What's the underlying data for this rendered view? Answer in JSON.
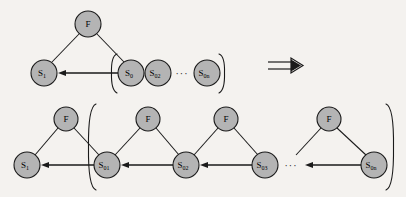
{
  "figure": {
    "type": "graph-rewriting-rule",
    "background_color": "#f4f2ef",
    "node_fill_color": "#b4b4b4",
    "node_stroke_color": "#1a1a1a",
    "implication_symbol": "⇒",
    "ellipsis_symbol": "···"
  },
  "top_row": {
    "label": "left-hand-side",
    "nodes": [
      {
        "id": "top-f",
        "label": "F",
        "sub": "",
        "cx": 88,
        "cy": 24,
        "r": 13
      },
      {
        "id": "top-s1",
        "label": "S",
        "sub": "1",
        "cx": 44,
        "cy": 73,
        "r": 13
      },
      {
        "id": "top-s0",
        "label": "S",
        "sub": "0",
        "cx": 131,
        "cy": 73,
        "r": 13
      },
      {
        "id": "top-s02",
        "label": "S",
        "sub": "02",
        "cx": 158,
        "cy": 73,
        "r": 13
      },
      {
        "id": "top-s0n",
        "label": "S",
        "sub": "0n",
        "cx": 207,
        "cy": 73,
        "r": 13
      }
    ],
    "edges": [
      {
        "from": "top-f",
        "to": "top-s1",
        "kind": "plain"
      },
      {
        "from": "top-f",
        "to": "top-s0",
        "kind": "plain"
      }
    ],
    "arrows": [
      {
        "from": "top-s0",
        "to": "top-s1",
        "kind": "arrow-left"
      }
    ],
    "ellipsis": {
      "x": 182,
      "y": 75
    },
    "brackets": [
      {
        "side": "open",
        "x": 113,
        "y_top": 54,
        "y_bottom": 93
      },
      {
        "side": "close",
        "x": 223,
        "y_top": 54,
        "y_bottom": 93
      }
    ]
  },
  "implication": {
    "symbol": "⇒",
    "x": 283,
    "y": 66
  },
  "bottom_row": {
    "label": "right-hand-side",
    "nodes": [
      {
        "id": "bot-f1",
        "label": "F",
        "sub": "",
        "cx": 66,
        "cy": 119,
        "r": 12
      },
      {
        "id": "bot-f2",
        "label": "F",
        "sub": "",
        "cx": 148,
        "cy": 119,
        "r": 12
      },
      {
        "id": "bot-f3",
        "label": "F",
        "sub": "",
        "cx": 226,
        "cy": 119,
        "r": 12
      },
      {
        "id": "bot-f4",
        "label": "F",
        "sub": "",
        "cx": 329,
        "cy": 119,
        "r": 12
      },
      {
        "id": "bot-s1",
        "label": "S",
        "sub": "1",
        "cx": 27,
        "cy": 165,
        "r": 13
      },
      {
        "id": "bot-s01",
        "label": "S",
        "sub": "01",
        "cx": 107,
        "cy": 165,
        "r": 13
      },
      {
        "id": "bot-s02",
        "label": "S",
        "sub": "02",
        "cx": 186,
        "cy": 165,
        "r": 13
      },
      {
        "id": "bot-s03",
        "label": "S",
        "sub": "03",
        "cx": 265,
        "cy": 165,
        "r": 13
      },
      {
        "id": "bot-s0n",
        "label": "S",
        "sub": "0n",
        "cx": 374,
        "cy": 165,
        "r": 13
      }
    ],
    "edges": [
      {
        "from": "bot-f1",
        "to": "bot-s1",
        "kind": "plain"
      },
      {
        "from": "bot-f1",
        "to": "bot-s01",
        "kind": "plain"
      },
      {
        "from": "bot-f2",
        "to": "bot-s01",
        "kind": "plain"
      },
      {
        "from": "bot-f2",
        "to": "bot-s02",
        "kind": "plain"
      },
      {
        "from": "bot-f3",
        "to": "bot-s02",
        "kind": "plain"
      },
      {
        "from": "bot-f3",
        "to": "bot-s03",
        "kind": "plain"
      },
      {
        "from": "bot-f4",
        "to": "bot-s0n",
        "kind": "plain"
      },
      {
        "from": "bot-f4",
        "to": "bot-dangling-left",
        "kind": "plain"
      }
    ],
    "arrows": [
      {
        "from": "bot-s01",
        "to": "bot-s1",
        "kind": "arrow-left"
      },
      {
        "from": "bot-s02",
        "to": "bot-s01",
        "kind": "arrow-left"
      },
      {
        "from": "bot-s03",
        "to": "bot-s02",
        "kind": "arrow-left"
      },
      {
        "from": "bot-s0n",
        "to": "bot-ellipsis",
        "kind": "arrow-left"
      }
    ],
    "ellipsis": {
      "x": 291,
      "y": 167
    },
    "brackets": [
      {
        "side": "open",
        "x": 90,
        "y_top": 104,
        "y_bottom": 190
      },
      {
        "side": "close",
        "x": 392,
        "y_top": 104,
        "y_bottom": 190
      }
    ]
  }
}
